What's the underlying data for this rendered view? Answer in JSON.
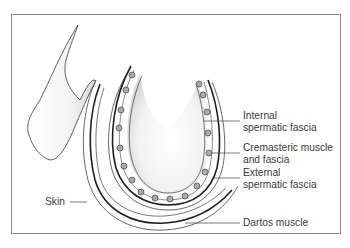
{
  "diagram": {
    "type": "anatomical-illustration",
    "colors": {
      "frame": "#8a8a8a",
      "line_dark": "#1e1e1e",
      "line_mid": "#555555",
      "dot_fill": "#a9a9a9",
      "dot_stroke": "#555555",
      "label_text": "#3a3a3a",
      "shading": "#d8d8d8"
    },
    "labels": [
      {
        "id": "internal",
        "line1": "Internal",
        "line2": "spermatic fascia"
      },
      {
        "id": "cremasteric",
        "line1": "Cremasteric muscle",
        "line2": "and fascia"
      },
      {
        "id": "external",
        "line1": "External",
        "line2": "spermatic fascia"
      },
      {
        "id": "skin",
        "line1": "Skin"
      },
      {
        "id": "dartos",
        "line1": "Dartos muscle"
      }
    ]
  }
}
